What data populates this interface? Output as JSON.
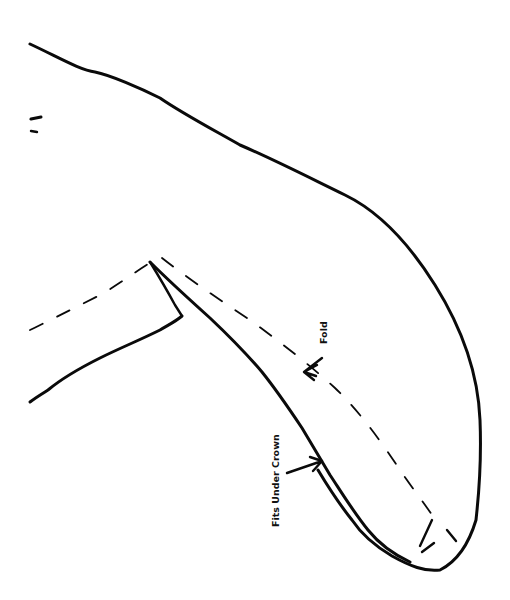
{
  "diagram": {
    "type": "sewing-pattern-piece",
    "labels": {
      "fold": "Fold",
      "fits_under_crown": "Fits Under Crown"
    },
    "colors": {
      "line": "#0a0a0a",
      "background": "#ffffff"
    }
  }
}
